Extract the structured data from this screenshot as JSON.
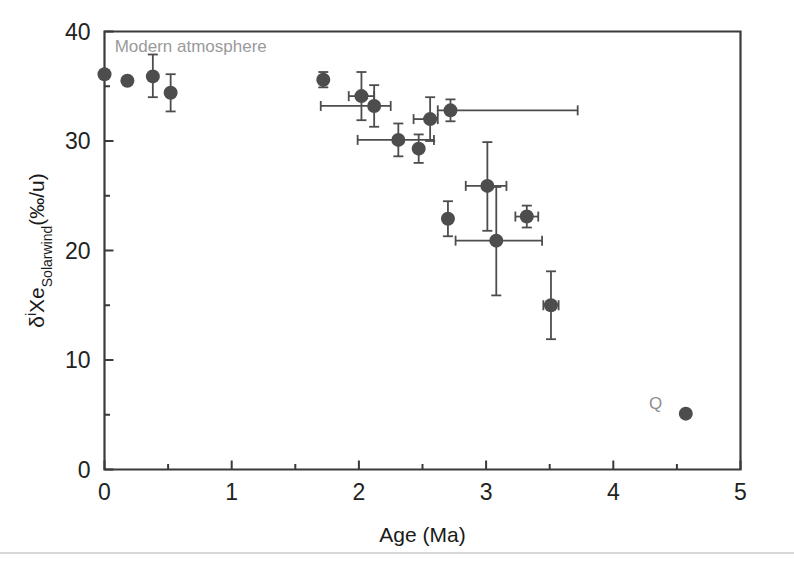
{
  "figure": {
    "background_color": "#ffffff",
    "axis_color": "#3a3a3a",
    "marker_color": "#4d4d4d",
    "errorbar_color": "#4d4d4d",
    "annotation_color": "#9a9a9a"
  },
  "axes": {
    "x_label": "Age (Ma)",
    "y_label_parts": {
      "delta": "δ",
      "superscript": "i",
      "element": "Xe",
      "subscript": "Solarwind",
      "units": "(‰/u)"
    },
    "y_label_plain": "δiXeSolarwind(‰/u)",
    "x_ticks": [
      "0",
      "1",
      "2",
      "3",
      "4",
      "5"
    ],
    "y_ticks": [
      "0",
      "10",
      "20",
      "30",
      "40"
    ]
  },
  "annotations": [
    {
      "name": "modern-atmosphere-label",
      "text": "Modern atmosphere",
      "x": 0.08,
      "y": 38.1,
      "color": "#9a9a9a",
      "size": 17
    },
    {
      "name": "q-label",
      "text": "Q",
      "x": 4.28,
      "y": 5.5,
      "color": "#8e8e8e",
      "size": 17
    }
  ],
  "chart_data": {
    "type": "scatter",
    "title": "",
    "xlabel": "Age (Ma)",
    "ylabel": "δiXeSolarwind(‰/u)",
    "xlim": [
      0,
      5
    ],
    "ylim": [
      0,
      40
    ],
    "grid": false,
    "legend": null,
    "x_major_ticks": [
      0,
      1,
      2,
      3,
      4,
      5
    ],
    "y_major_ticks": [
      0,
      10,
      20,
      30,
      40
    ],
    "y_minor_ticks": [
      5,
      15,
      25,
      35
    ],
    "x_minor_ticks": [
      0.5,
      1.5,
      2.5,
      3.5,
      4.5
    ],
    "points": [
      {
        "label": "modern-atmosphere",
        "x": 0.0,
        "y": 36.1,
        "xerr_low": 0.0,
        "xerr_high": 0.0,
        "yerr_low": 0.0,
        "yerr_high": 0.0
      },
      {
        "label": "p2",
        "x": 0.18,
        "y": 35.5,
        "xerr_low": 0.0,
        "xerr_high": 0.0,
        "yerr_low": 0.0,
        "yerr_high": 0.0
      },
      {
        "label": "p3",
        "x": 0.38,
        "y": 35.9,
        "xerr_low": 0.0,
        "xerr_high": 0.0,
        "yerr_low": 1.9,
        "yerr_high": 2.0
      },
      {
        "label": "p4",
        "x": 0.52,
        "y": 34.4,
        "xerr_low": 0.0,
        "xerr_high": 0.0,
        "yerr_low": 1.7,
        "yerr_high": 1.7
      },
      {
        "label": "p5",
        "x": 1.72,
        "y": 35.6,
        "xerr_low": 0.0,
        "xerr_high": 0.0,
        "yerr_low": 0.7,
        "yerr_high": 0.7
      },
      {
        "label": "p6",
        "x": 2.02,
        "y": 34.1,
        "xerr_low": 0.1,
        "xerr_high": 0.1,
        "yerr_low": 2.2,
        "yerr_high": 2.2
      },
      {
        "label": "p7",
        "x": 2.12,
        "y": 33.2,
        "xerr_low": 0.42,
        "xerr_high": 0.13,
        "yerr_low": 1.9,
        "yerr_high": 1.9
      },
      {
        "label": "p8",
        "x": 2.31,
        "y": 30.1,
        "xerr_low": 0.32,
        "xerr_high": 0.28,
        "yerr_low": 1.5,
        "yerr_high": 1.5
      },
      {
        "label": "p9",
        "x": 2.47,
        "y": 29.3,
        "xerr_low": 0.0,
        "xerr_high": 0.0,
        "yerr_low": 1.3,
        "yerr_high": 1.3
      },
      {
        "label": "p10",
        "x": 2.56,
        "y": 32.0,
        "xerr_low": 0.13,
        "xerr_high": 0.06,
        "yerr_low": 2.0,
        "yerr_high": 2.0
      },
      {
        "label": "p11",
        "x": 2.72,
        "y": 32.8,
        "xerr_low": 0.1,
        "xerr_high": 1.0,
        "yerr_low": 1.0,
        "yerr_high": 1.0
      },
      {
        "label": "p12",
        "x": 2.7,
        "y": 22.9,
        "xerr_low": 0.0,
        "xerr_high": 0.0,
        "yerr_low": 1.6,
        "yerr_high": 1.6
      },
      {
        "label": "p13",
        "x": 3.01,
        "y": 25.9,
        "xerr_low": 0.17,
        "xerr_high": 0.15,
        "yerr_low": 4.1,
        "yerr_high": 4.0
      },
      {
        "label": "p14",
        "x": 3.08,
        "y": 20.9,
        "xerr_low": 0.32,
        "xerr_high": 0.36,
        "yerr_low": 5.0,
        "yerr_high": 4.9
      },
      {
        "label": "p15",
        "x": 3.32,
        "y": 23.1,
        "xerr_low": 0.09,
        "xerr_high": 0.09,
        "yerr_low": 1.0,
        "yerr_high": 1.0
      },
      {
        "label": "p16",
        "x": 3.51,
        "y": 15.0,
        "xerr_low": 0.06,
        "xerr_high": 0.06,
        "yerr_low": 3.1,
        "yerr_high": 3.1
      },
      {
        "label": "q-phase",
        "x": 4.57,
        "y": 5.1,
        "xerr_low": 0.0,
        "xerr_high": 0.0,
        "yerr_low": 0.0,
        "yerr_high": 0.0
      }
    ]
  }
}
